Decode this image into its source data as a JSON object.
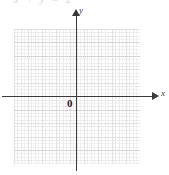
{
  "figure": {
    "kind": "coordinate-grid",
    "caption": "x + y = 2",
    "origin_label": "0",
    "x_axis_label": "x",
    "y_axis_label": "y",
    "colors": {
      "axis": "#3a3a3a",
      "major_grid": "#c9c9c9",
      "minor_grid": "#e4e4e4",
      "background": "#ffffff",
      "origin_text": "#1e1e1e"
    }
  },
  "chart_data": {
    "type": "line",
    "title": "x + y = 2",
    "xlabel": "x",
    "ylabel": "y",
    "xlim": [
      -4.5,
      4.5
    ],
    "ylim": [
      -5,
      5
    ],
    "grid": true,
    "minor_grid": true,
    "major_tick_step": 1,
    "minor_ticks_per_major": 4,
    "legend": "none",
    "series": [],
    "annotations": [
      {
        "text": "0",
        "x": -0.35,
        "y": -0.45
      },
      {
        "text": "x",
        "x": 4.9,
        "y": 0.3
      },
      {
        "text": "y",
        "x": 0.25,
        "y": 5.2
      }
    ]
  }
}
